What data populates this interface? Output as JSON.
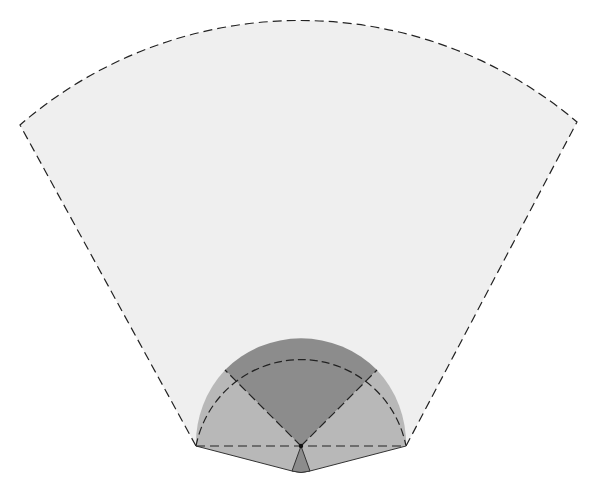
{
  "diagram": {
    "colors": {
      "background": "#ffffff",
      "large_sector_fill": "#efefef",
      "side_sectors_fill": "#b8b8b8",
      "center_sector_fill": "#8c8c8c",
      "bottom_wedge_fill": "#8c8c8c",
      "lower_band_fill": "#b8b8b8",
      "stroke": "#222222"
    },
    "geometry": {
      "pivot": [
        301,
        446
      ],
      "large_sector": {
        "left_corner": [
          20,
          125
        ],
        "right_corner": [
          577,
          122
        ],
        "radius": 428
      },
      "small_semicircle": {
        "left": [
          196,
          446
        ],
        "right": [
          406,
          446
        ],
        "radius": 107,
        "top_y": 337
      },
      "center_sector_edges": {
        "left_end": [
          225,
          370
        ],
        "right_end": [
          377,
          370
        ]
      },
      "bottom_wedge": {
        "left": [
          292,
          471
        ],
        "right": [
          310,
          471
        ]
      }
    },
    "labels": []
  }
}
